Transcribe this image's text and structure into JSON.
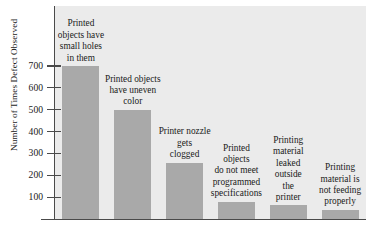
{
  "chart_data": {
    "type": "bar",
    "title": "",
    "xlabel": "",
    "ylabel": "Number of Times Defect Observed",
    "ylim": [
      0,
      760
    ],
    "yticks": [
      100,
      200,
      300,
      400,
      500,
      600,
      700
    ],
    "grid": false,
    "legend": "none",
    "categories": [
      "Printed objects have small holes in them",
      "Printed objects have uneven color",
      "Printer nozzle gets clogged",
      "Printed objects do not meet programmed specifications",
      "Printing material leaked outside the printer",
      "Printing material is not feeding properly"
    ],
    "category_lines": [
      [
        "Printed",
        "objects have",
        "small holes",
        "in them"
      ],
      [
        "Printed objects",
        "have uneven",
        "color"
      ],
      [
        "Printer nozzle",
        "gets",
        "clogged"
      ],
      [
        "Printed",
        "objects",
        "do not meet",
        "programmed",
        "specifications"
      ],
      [
        "Printing",
        "material",
        "leaked",
        "outside",
        "the",
        "printer"
      ],
      [
        "Printing",
        "material is",
        "not feeding",
        "properly"
      ]
    ],
    "values": [
      700,
      500,
      258,
      80,
      62,
      42
    ],
    "bar_color": "#a9a9a9",
    "panel_color": "#ebebeb",
    "axis_color": "#4a4a4a",
    "text_color": "#1a1a1a"
  }
}
